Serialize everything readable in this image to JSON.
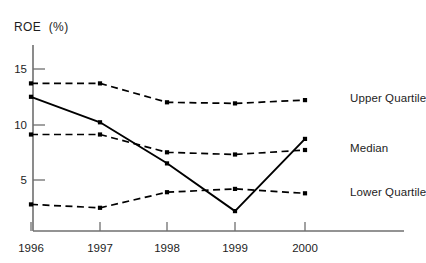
{
  "chart_data": {
    "type": "line",
    "title": "",
    "ylabel": "ROE  (%)",
    "xlabel": "",
    "categories": [
      "1996",
      "1997",
      "1998",
      "1999",
      "2000"
    ],
    "x": [
      1996,
      1997,
      1998,
      1999,
      2000
    ],
    "ylim": [
      0,
      16.5
    ],
    "xlim": [
      1995.7,
      2000.4
    ],
    "yticks": [
      5,
      10,
      15
    ],
    "ytick_labels": [
      "5",
      "10",
      "15"
    ],
    "xtick_labels": [
      "1996",
      "1997",
      "1998",
      "1999",
      "2000"
    ],
    "grid": false,
    "legend_position": "right-inline",
    "series": [
      {
        "name": "Upper Quartile",
        "style": "dashed",
        "marker": "square",
        "color": "#000000",
        "values": [
          13.7,
          13.7,
          12.0,
          11.9,
          12.2
        ]
      },
      {
        "name": "Median",
        "style": "dashed",
        "marker": "square",
        "color": "#000000",
        "values": [
          9.1,
          9.1,
          7.5,
          7.3,
          7.7
        ]
      },
      {
        "name": "Lower Quartile",
        "style": "dashed",
        "marker": "square",
        "color": "#000000",
        "values": [
          2.8,
          2.5,
          3.9,
          4.2,
          3.8
        ]
      },
      {
        "name": "Company",
        "style": "solid",
        "marker": "square",
        "color": "#000000",
        "values": [
          12.5,
          10.2,
          6.5,
          2.2,
          8.7
        ]
      }
    ]
  },
  "axis": {
    "y_label": "ROE  (%)",
    "y_ticks": [
      "15",
      "10",
      "5"
    ],
    "x_ticks": [
      "1996",
      "1997",
      "1998",
      "1999",
      "2000"
    ]
  },
  "legend": {
    "upper": "Upper Quartile",
    "median": "Median",
    "lower": "Lower Quartile"
  },
  "colors": {
    "ink": "#1d1d1d",
    "line": "#000000",
    "axis": "#6f6f6f",
    "background": "#ffffff"
  }
}
